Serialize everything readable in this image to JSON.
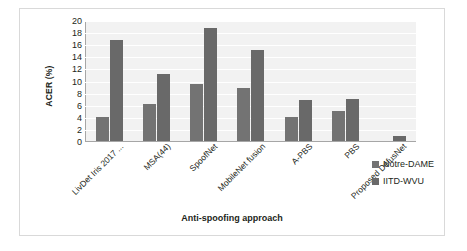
{
  "chart_data": {
    "type": "bar",
    "title": "",
    "xlabel": "Anti-spoofing approach",
    "ylabel": "ACER (%)",
    "ylim": [
      0,
      20
    ],
    "yticks": [
      0,
      2,
      4,
      6,
      8,
      10,
      12,
      14,
      16,
      18,
      20
    ],
    "grid": true,
    "legend_position": "bottom-right",
    "categories": [
      "LivDet Iris 2017 ...",
      "MSA(44)",
      "SpoofNet",
      "MobileNet fusion",
      "A-PBS",
      "PBS",
      "Proposed DefusNet"
    ],
    "series": [
      {
        "name": "Notre-DAME",
        "color": "#737373",
        "values": [
          4.0,
          6.2,
          9.4,
          8.8,
          3.9,
          4.9,
          0.0
        ]
      },
      {
        "name": "IITD-WVU",
        "color": "#696969",
        "values": [
          16.7,
          11.0,
          18.6,
          15.0,
          6.8,
          6.9,
          0.9
        ]
      }
    ]
  },
  "legend": {
    "items": [
      {
        "label": "Notre-DAME"
      },
      {
        "label": "IITD-WVU"
      }
    ]
  }
}
